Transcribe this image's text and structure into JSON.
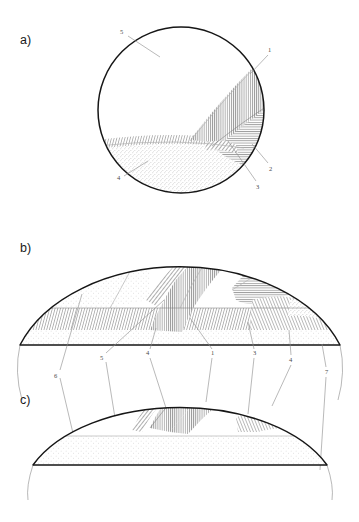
{
  "figure": {
    "background_color": "#ffffff",
    "ink_color": "#161616",
    "leader_color": "#8d8d8d",
    "label_color": "#4a4a4a"
  },
  "panels": [
    {
      "id": "a",
      "letter": "a)",
      "shape": "circle",
      "callouts": [
        {
          "id": "a-5",
          "label": "5",
          "x": 122,
          "y": 33,
          "tip_x": 160,
          "tip_y": 57
        },
        {
          "id": "a-1",
          "label": "1",
          "x": 270,
          "y": 52,
          "tip_x": 251,
          "tip_y": 73
        },
        {
          "id": "a-2",
          "label": "2",
          "x": 271,
          "y": 167,
          "tip_x": 252,
          "tip_y": 145
        },
        {
          "id": "a-3",
          "label": "3",
          "x": 258,
          "y": 185,
          "tip_x": 228,
          "tip_y": 142
        },
        {
          "id": "a-4",
          "label": "4",
          "x": 119,
          "y": 178,
          "tip_x": 147,
          "tip_y": 162
        }
      ]
    },
    {
      "id": "b",
      "letter": "b)",
      "shape": "dome",
      "callouts": [
        {
          "id": "b-6",
          "label": "6",
          "x": 57,
          "y": 375,
          "tip_x": 80,
          "tip_y": 293
        },
        {
          "id": "b-5",
          "label": "5",
          "x": 103,
          "y": 357,
          "tip_x": 163,
          "tip_y": 300
        },
        {
          "id": "b-4b",
          "label": "4",
          "x": 148,
          "y": 352,
          "tip_x": 155,
          "tip_y": 328
        },
        {
          "id": "b-1",
          "label": "1",
          "x": 214,
          "y": 352,
          "tip_x": 190,
          "tip_y": 318
        },
        {
          "id": "b-3",
          "label": "3",
          "x": 256,
          "y": 352,
          "tip_x": 248,
          "tip_y": 323
        },
        {
          "id": "b-4",
          "label": "4",
          "x": 292,
          "y": 358,
          "tip_x": 289,
          "tip_y": 330
        },
        {
          "id": "b-7",
          "label": "7",
          "x": 327,
          "y": 370,
          "tip_x": 322,
          "tip_y": 345
        }
      ]
    },
    {
      "id": "c",
      "letter": "c)",
      "shape": "flat-dome",
      "callouts": []
    }
  ],
  "legend_numbers": [
    "1",
    "2",
    "3",
    "4",
    "5",
    "6",
    "7"
  ]
}
